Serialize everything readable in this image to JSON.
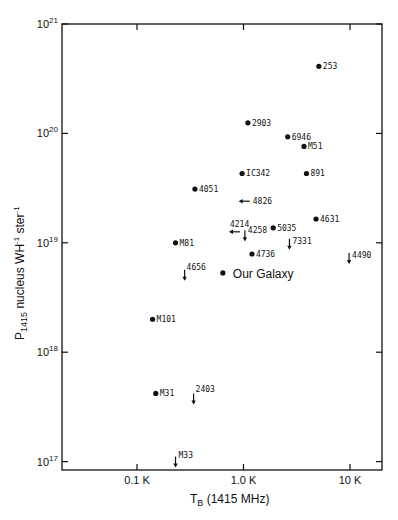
{
  "chart_data": {
    "type": "scatter",
    "title": "",
    "xlabel": "T_B (1415 MHz)",
    "ylabel": "P_1415 nucleus WH^-1 ster^-1",
    "xscale": "log",
    "yscale": "log",
    "xlim": [
      0.02,
      20
    ],
    "ylim": [
      1e+17,
      1e+21
    ],
    "x_ticks": [
      {
        "value": 0.1,
        "label": "0.1 K"
      },
      {
        "value": 1.0,
        "label": "1.0 K"
      },
      {
        "value": 10,
        "label": "10 K"
      }
    ],
    "y_ticks": [
      {
        "value": 1e+21,
        "base": "10",
        "exp": "21"
      },
      {
        "value": 1e+20,
        "base": "10",
        "exp": "20"
      },
      {
        "value": 1e+19,
        "base": "10",
        "exp": "19"
      },
      {
        "value": 1e+18,
        "base": "10",
        "exp": "18"
      },
      {
        "value": 1e+17,
        "base": "10",
        "exp": "17"
      }
    ],
    "grid": false,
    "legend": null,
    "points": [
      {
        "label": "253",
        "x": 5.1,
        "y": 4.1e+20,
        "marker": "dot"
      },
      {
        "label": "2903",
        "x": 1.1,
        "y": 1.25e+20,
        "marker": "dot"
      },
      {
        "label": "6946",
        "x": 2.6,
        "y": 9.3e+19,
        "marker": "dot"
      },
      {
        "label": "M51",
        "x": 3.7,
        "y": 7.6e+19,
        "marker": "dot"
      },
      {
        "label": "IC342",
        "x": 0.97,
        "y": 4.3e+19,
        "marker": "dot"
      },
      {
        "label": "891",
        "x": 3.9,
        "y": 4.3e+19,
        "marker": "dot"
      },
      {
        "label": "4051",
        "x": 0.35,
        "y": 3.1e+19,
        "marker": "dot"
      },
      {
        "label": "4826",
        "x": 1.05,
        "y": 2.4e+19,
        "marker": "arrow-left"
      },
      {
        "label": "4631",
        "x": 4.8,
        "y": 1.65e+19,
        "marker": "dot"
      },
      {
        "label": "4214",
        "x": 0.85,
        "y": 1.26e+19,
        "marker": "arrow-left"
      },
      {
        "label": "5035",
        "x": 1.9,
        "y": 1.37e+19,
        "marker": "dot"
      },
      {
        "label": "4258",
        "x": 1.03,
        "y": 1.15e+19,
        "marker": "arrow-down"
      },
      {
        "label": "M81",
        "x": 0.23,
        "y": 1e+19,
        "marker": "dot"
      },
      {
        "label": "7331",
        "x": 2.7,
        "y": 9.6e+18,
        "marker": "arrow-down"
      },
      {
        "label": "4736",
        "x": 1.2,
        "y": 7.9e+18,
        "marker": "dot"
      },
      {
        "label": "4490",
        "x": 9.8,
        "y": 7.1e+18,
        "marker": "arrow-down"
      },
      {
        "label": "4656",
        "x": 0.28,
        "y": 5e+18,
        "marker": "arrow-down"
      },
      {
        "label": "Our Galaxy",
        "x": 0.64,
        "y": 5.3e+18,
        "marker": "dot"
      },
      {
        "label": "M101",
        "x": 0.14,
        "y": 2e+18,
        "marker": "dot"
      },
      {
        "label": "M31",
        "x": 0.15,
        "y": 4.2e+17,
        "marker": "dot"
      },
      {
        "label": "2403",
        "x": 0.34,
        "y": 3.7e+17,
        "marker": "arrow-down"
      },
      {
        "label": "M33",
        "x": 0.23,
        "y": 9.8e+16,
        "marker": "arrow-down"
      }
    ]
  },
  "axis": {
    "x_title_main": "T",
    "x_title_sub": "B",
    "x_title_rest": " (1415 MHz)",
    "y_title_main": "P",
    "y_title_sub": "1415",
    "y_title_rest": " nucleus WH",
    "y_title_sup1": "-1",
    "y_title_rest2": " ster",
    "y_title_sup2": "-1"
  }
}
